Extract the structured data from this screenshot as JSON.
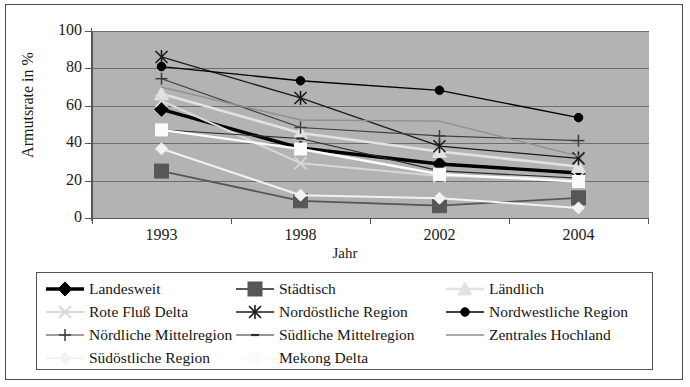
{
  "chart_data": {
    "type": "line",
    "title": "",
    "xlabel": "Jahr",
    "ylabel": "Armutsrate in %",
    "categories": [
      "1993",
      "1998",
      "2002",
      "2004"
    ],
    "x_tick_labels": [
      "1993",
      "1998",
      "2002",
      "2004"
    ],
    "y_tick_labels": [
      "0",
      "20",
      "40",
      "60",
      "80",
      "100"
    ],
    "ylim": [
      0,
      100
    ],
    "y_ticks": [
      0,
      20,
      40,
      60,
      80,
      100
    ],
    "grid": true,
    "legend_position": "bottom",
    "plot_background": "#b3b3b3",
    "series": [
      {
        "name": "Landesweit",
        "values": [
          58.1,
          37.4,
          28.9,
          24.1
        ],
        "color": "#000000",
        "marker": "diamond",
        "marker_size": 7,
        "line_width": 3.4
      },
      {
        "name": "Städtisch",
        "values": [
          25.1,
          9.2,
          6.6,
          10.8
        ],
        "color": "#575757",
        "marker": "square",
        "marker_size": 7,
        "line_width": 1.8
      },
      {
        "name": "Ländlich",
        "values": [
          66.4,
          45.5,
          35.6,
          27.5
        ],
        "color": "#e2e2e2",
        "marker": "triangle",
        "marker_size": 7,
        "line_width": 2.6
      },
      {
        "name": "Rote Fluß Delta",
        "values": [
          62.7,
          29.3,
          22.4,
          21.5
        ],
        "color": "#d8d8d8",
        "marker": "x",
        "marker_size": 6,
        "line_width": 2.0
      },
      {
        "name": "Nordöstliche Region",
        "values": [
          86.1,
          64.2,
          38.4,
          31.9
        ],
        "color": "#1a1a1a",
        "marker": "star",
        "marker_size": 6,
        "line_width": 1.3
      },
      {
        "name": "Nordwestliche Region",
        "values": [
          81.0,
          73.4,
          68.3,
          53.7
        ],
        "color": "#000000",
        "marker": "circle",
        "marker_size": 5,
        "line_width": 1.3
      },
      {
        "name": "Nördliche Mittelregion",
        "values": [
          74.5,
          48.4,
          43.9,
          41.4
        ],
        "color": "#3d3d3d",
        "marker": "plus",
        "marker_size": 6,
        "line_width": 1.1
      },
      {
        "name": "Südliche Mittelregion",
        "values": [
          47.2,
          42.5,
          25.2,
          21.3
        ],
        "color": "#2b2b2b",
        "marker": "dash",
        "marker_size": 4,
        "line_width": 1.1
      },
      {
        "name": "Zentrales Hochland",
        "values": [
          70.0,
          52.4,
          51.8,
          33.1
        ],
        "color": "#8e8e8e",
        "marker": "none",
        "marker_size": 0,
        "line_width": 1.4
      },
      {
        "name": "Südöstliche Region",
        "values": [
          37.0,
          12.2,
          10.6,
          5.4
        ],
        "color": "#f2f2f2",
        "marker": "diamond",
        "marker_size": 6,
        "line_width": 2.0
      },
      {
        "name": "Mekong Delta",
        "values": [
          47.1,
          36.9,
          23.4,
          19.5
        ],
        "color": "#fbfbfb",
        "marker": "square",
        "marker_size": 6,
        "line_width": 2.4
      }
    ]
  },
  "axes": {
    "y_title": "Armutsrate in %",
    "x_title": "Jahr"
  },
  "legend": {
    "rows": [
      [
        {
          "label": "Landesweit",
          "series": 0
        },
        {
          "label": "Städtisch",
          "series": 1
        },
        {
          "label": "Ländlich",
          "series": 2
        }
      ],
      [
        {
          "label": "Rote Fluß Delta",
          "series": 3
        },
        {
          "label": "Nordöstliche Region",
          "series": 4
        },
        {
          "label": "Nordwestliche Region",
          "series": 5
        }
      ],
      [
        {
          "label": "Nördliche Mittelregion",
          "series": 6
        },
        {
          "label": "Südliche Mittelregion",
          "series": 7
        },
        {
          "label": "Zentrales Hochland",
          "series": 8
        }
      ],
      [
        {
          "label": "Südöstliche Region",
          "series": 9
        },
        {
          "label": "Mekong Delta",
          "series": 10
        },
        {
          "label": "",
          "series": -1
        }
      ]
    ]
  }
}
